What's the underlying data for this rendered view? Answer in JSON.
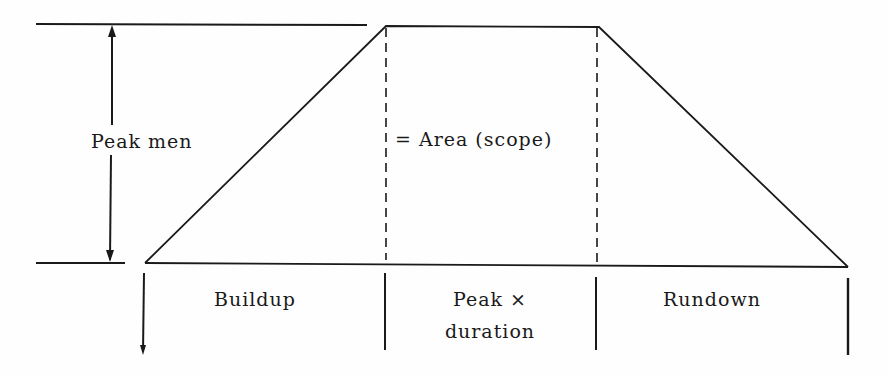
{
  "diagram": {
    "type": "manpower-loading-trapezoid",
    "labels": {
      "peak_men": "Peak men",
      "area": "= Area (scope)",
      "buildup": "Buildup",
      "peak_duration_line1": "Peak ×",
      "peak_duration_line2": "duration",
      "rundown": "Rundown"
    },
    "phases": [
      "Buildup",
      "Peak × duration",
      "Rundown"
    ],
    "colors": {
      "line": "#1a1a1a",
      "background": "#fefefe"
    }
  }
}
